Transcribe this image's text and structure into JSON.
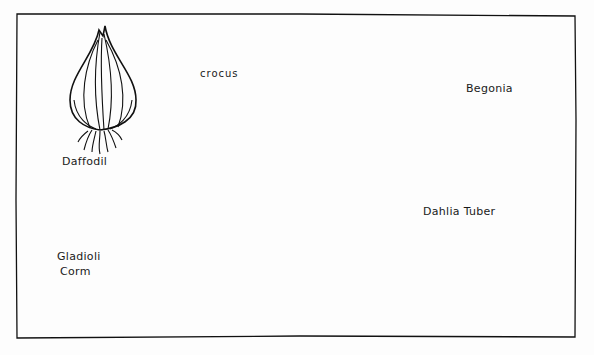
{
  "illustration": {
    "style": "pen-and-ink botanical sketch",
    "ink_color": "#111111",
    "paper_color": "#fdfdfd",
    "labels": {
      "daffodil": "Daffodil",
      "crocus": "crocus",
      "begonia": "Begonia",
      "gladioli_line1": "Gladioli",
      "gladioli_line2": "Corm",
      "dahlia": "Dahlia Tuber"
    }
  }
}
